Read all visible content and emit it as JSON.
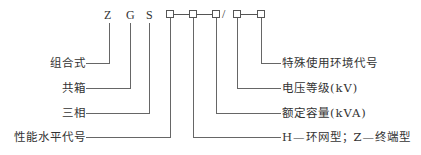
{
  "code": {
    "letters": [
      "Z",
      "G",
      "S"
    ],
    "separator": "/"
  },
  "left_labels": {
    "z": "组合式",
    "g": "共箱",
    "s": "三相",
    "b1": "性能水平代号"
  },
  "right_labels": {
    "b5": "特殊使用环境代号",
    "b4": "电压等级(kV)",
    "b3": "额定容量(kVA)",
    "b2": "H—环网型；Z—终端型"
  }
}
